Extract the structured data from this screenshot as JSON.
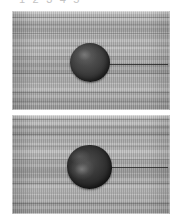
{
  "figure": {
    "name": "droplet-contact-angle-sequence",
    "caption_top": "1 2 3 4 5",
    "background_color": "#ffffff",
    "panel_count": 2
  },
  "panels": [
    {
      "id": "panel-top",
      "label": "upper-frame",
      "substrate_color": "#a6a6a6",
      "droplet_color": "#262626",
      "droplet": {
        "name": "sessile-droplet-upper",
        "shape": "near-spherical",
        "highlight_position": "upper-left",
        "baseline_visible": "yes"
      }
    },
    {
      "id": "panel-bottom",
      "label": "lower-frame",
      "substrate_color": "#a2a2a2",
      "droplet_color": "#1a1a1a",
      "droplet": {
        "name": "sessile-droplet-lower",
        "shape": "slightly-irregular-spheroid",
        "highlight_position": "center-left",
        "baseline_visible": "yes"
      }
    }
  ]
}
